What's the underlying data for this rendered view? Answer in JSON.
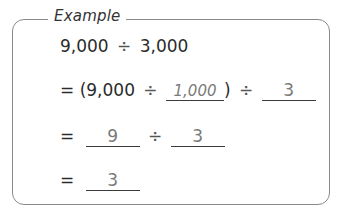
{
  "example": {
    "title": "Example",
    "problem": {
      "dividend": "9,000",
      "operator": "÷",
      "divisor": "3,000"
    },
    "steps": [
      {
        "prefix": "= (",
        "left": "9,000",
        "operator": "÷",
        "blank1": "1,000",
        "close": ")",
        "operator2": "÷",
        "blank2": "3"
      },
      {
        "prefix": "=",
        "blank1": "9",
        "operator": "÷",
        "blank2": "3"
      },
      {
        "prefix": "=",
        "blank1": "3"
      }
    ]
  }
}
